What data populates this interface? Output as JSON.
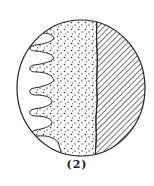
{
  "figure": {
    "caption": "(2)",
    "colors": {
      "stroke": "#222222",
      "background": "#ffffff",
      "dots": "#333333",
      "hatch": "#2a2a2a"
    },
    "regions": [
      {
        "name": "outer-clear-region",
        "fill": "blank"
      },
      {
        "name": "stippled-region",
        "fill": "dots"
      },
      {
        "name": "hatched-region",
        "fill": "diagonal-lines"
      }
    ],
    "projections_count": 6
  }
}
